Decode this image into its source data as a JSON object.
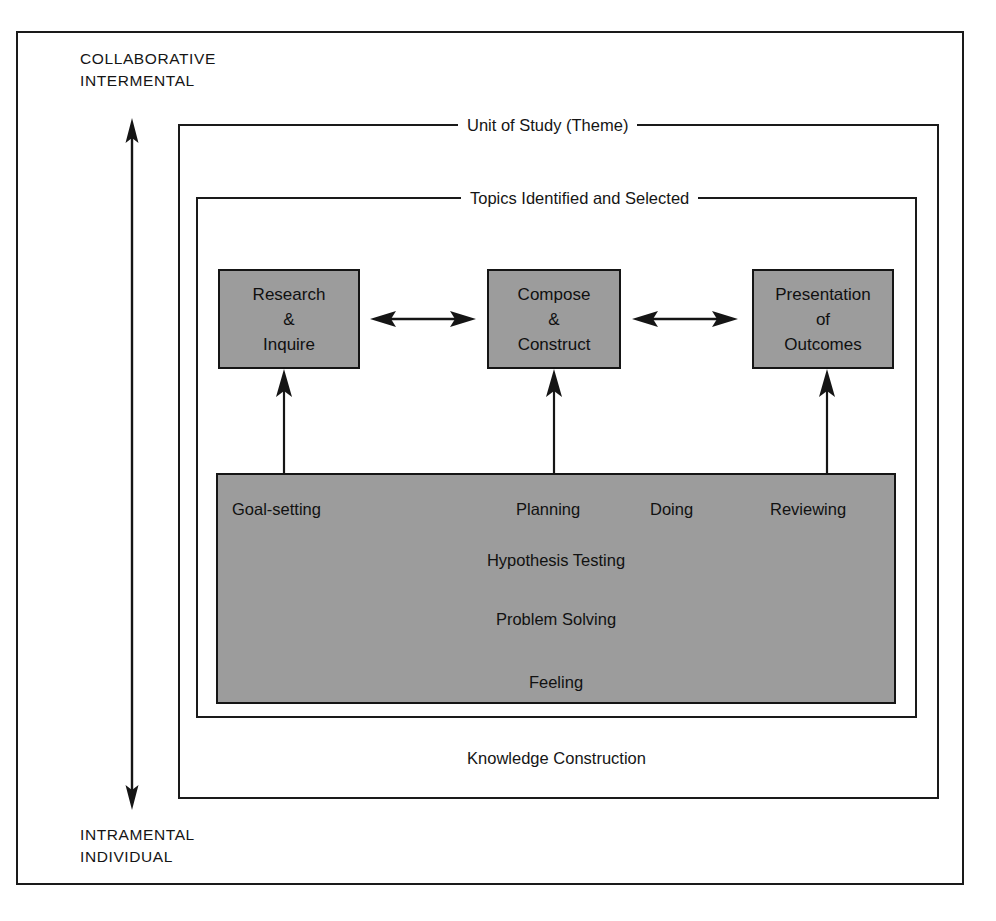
{
  "diagram": {
    "axis": {
      "top_label": "COLLABORATIVE\nINTERMENTAL",
      "bottom_label": "INTRAMENTAL\nINDIVIDUAL",
      "arrow_icon": "double-headed-vertical-arrow-icon"
    },
    "frames": [
      {
        "id": "unit-of-study",
        "caption": "Unit of Study (Theme)"
      },
      {
        "id": "topics",
        "caption": "Topics Identified and Selected"
      }
    ],
    "stages": [
      {
        "id": "research",
        "lines": [
          "Research",
          "&",
          "Inquire"
        ]
      },
      {
        "id": "compose",
        "lines": [
          "Compose",
          "&",
          "Construct"
        ]
      },
      {
        "id": "presentation",
        "lines": [
          "Presentation",
          "of",
          "Outcomes"
        ]
      }
    ],
    "stage_connectors": [
      {
        "id": "research-to-compose",
        "icon": "double-headed-horizontal-arrow-icon"
      },
      {
        "id": "compose-to-presentation",
        "icon": "double-headed-horizontal-arrow-icon"
      }
    ],
    "feed_arrows": [
      {
        "id": "process-to-research",
        "icon": "up-arrow-icon"
      },
      {
        "id": "process-to-compose",
        "icon": "up-arrow-icon"
      },
      {
        "id": "process-to-presentation",
        "icon": "up-arrow-icon"
      }
    ],
    "process_panel": {
      "top_row": [
        "Goal-setting",
        "Planning",
        "Doing",
        "Reviewing"
      ],
      "centered_rows": [
        "Hypothesis Testing",
        "Problem Solving",
        "Feeling"
      ]
    },
    "knowledge_caption": "Knowledge Construction",
    "colors": {
      "panel_fill": "#9c9c9c",
      "stroke": "#151515",
      "background": "#ffffff"
    }
  }
}
